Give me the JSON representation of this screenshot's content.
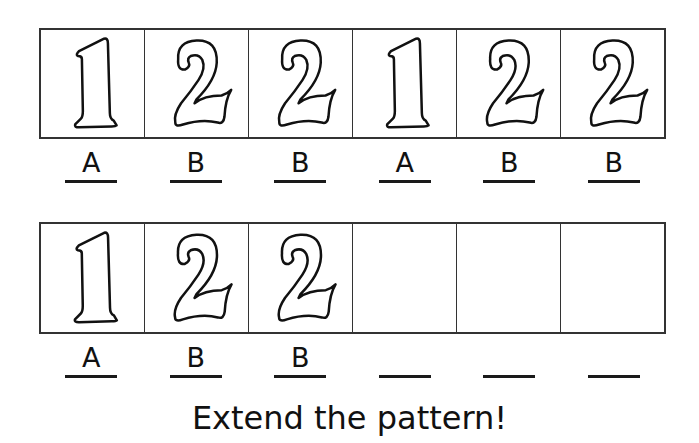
{
  "worksheet": {
    "rows": [
      {
        "cells": [
          {
            "digit": "1",
            "label": "A"
          },
          {
            "digit": "2",
            "label": "B"
          },
          {
            "digit": "2",
            "label": "B"
          },
          {
            "digit": "1",
            "label": "A"
          },
          {
            "digit": "2",
            "label": "B"
          },
          {
            "digit": "2",
            "label": "B"
          }
        ]
      },
      {
        "cells": [
          {
            "digit": "1",
            "label": "A"
          },
          {
            "digit": "2",
            "label": "B"
          },
          {
            "digit": "2",
            "label": "B"
          },
          {
            "digit": "",
            "label": ""
          },
          {
            "digit": "",
            "label": ""
          },
          {
            "digit": "",
            "label": ""
          }
        ]
      }
    ],
    "instruction": "Extend the pattern!"
  }
}
